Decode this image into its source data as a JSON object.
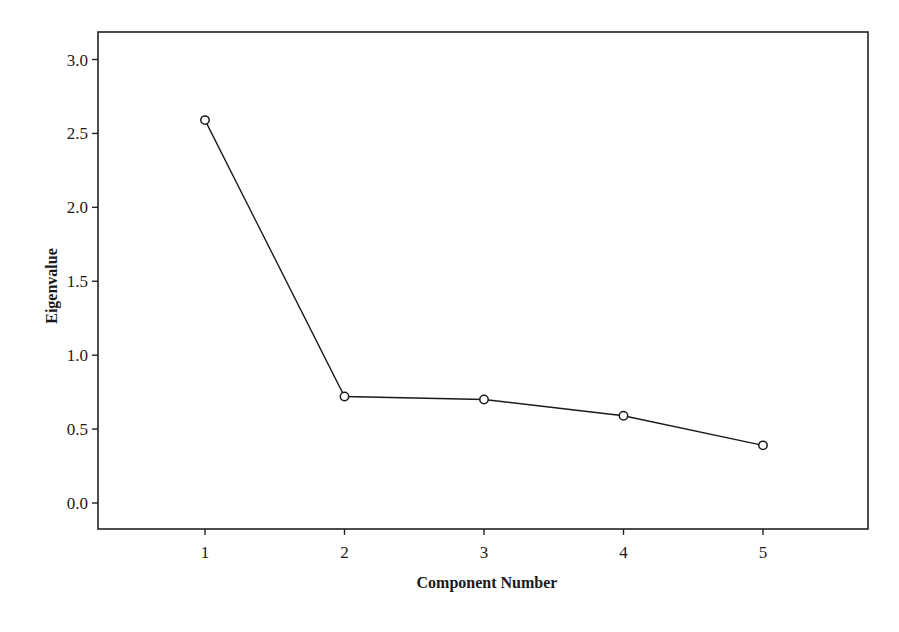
{
  "chart_data": {
    "type": "line",
    "title": "",
    "xlabel": "Component Number",
    "ylabel": "Eigenvalue",
    "x": [
      1,
      2,
      3,
      4,
      5
    ],
    "categories": [
      "1",
      "2",
      "3",
      "4",
      "5"
    ],
    "series": [
      {
        "name": "Eigenvalue",
        "values": [
          2.59,
          0.72,
          0.7,
          0.59,
          0.39
        ],
        "marker": "open-circle",
        "color": "#1a1a1a"
      }
    ],
    "ylim": [
      -0.15,
      3.2
    ],
    "xlim": [
      0.05,
      5.75
    ],
    "yticks": [
      0.0,
      0.5,
      1.0,
      1.5,
      2.0,
      2.5,
      3.0
    ],
    "ytick_labels": [
      "0.0",
      "0.5",
      "1.0",
      "1.5",
      "2.0",
      "2.5",
      "3.0"
    ],
    "xticks": [
      1,
      2,
      3,
      4,
      5
    ],
    "xtick_labels": [
      "1",
      "2",
      "3",
      "4",
      "5"
    ],
    "grid": false,
    "legend": "none"
  },
  "layout": {
    "plot_box": {
      "left": 98,
      "top": 32,
      "right": 868,
      "bottom": 529
    },
    "y_pixel": {
      "v0": 503,
      "v3": 59.5
    },
    "x_pixel": {
      "x1": 205,
      "x5": 763
    },
    "line_color": "#1a1a1a",
    "axis_color": "#222222"
  }
}
